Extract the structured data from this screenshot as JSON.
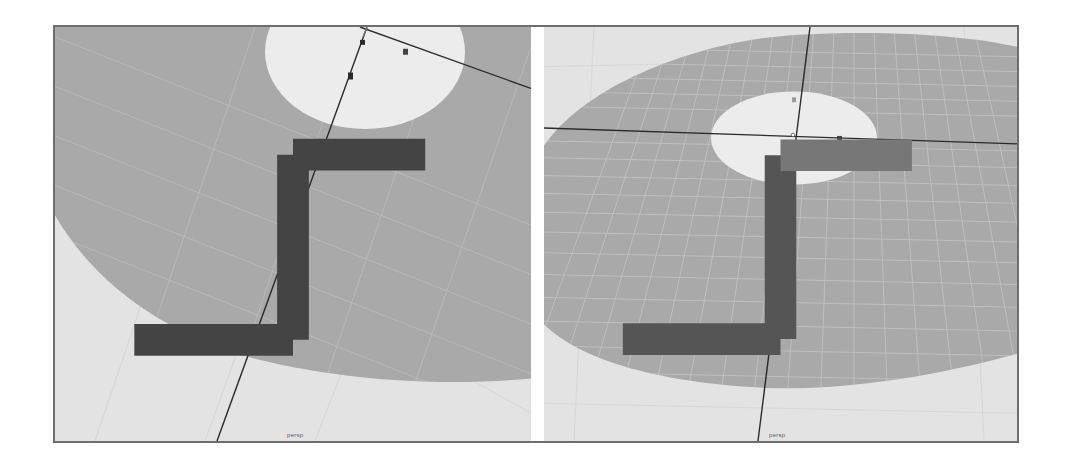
{
  "viewports": [
    {
      "id": "left",
      "camera_label": "persp",
      "axis_indicator": "xyz-axis-gizmo",
      "object": "disc-annulus",
      "manipulator": "move-tool"
    },
    {
      "id": "right",
      "camera_label": "persp",
      "axis_indicator": "xyz-axis-gizmo",
      "object": "disc-annulus",
      "manipulator": "move-tool"
    }
  ],
  "colors": {
    "background": "#e3e3e3",
    "disc": "#a9a9a9",
    "grid": "#c8c8c8",
    "hole": "#ececec",
    "manipulator": "#2a2a2a",
    "frame": "#6e6e6e"
  }
}
